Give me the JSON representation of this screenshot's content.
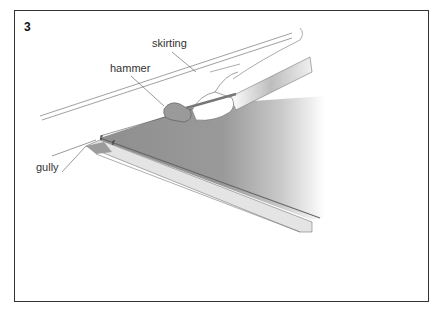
{
  "figure": {
    "number": "3",
    "labels": {
      "skirting": "skirting",
      "hammer": "hammer",
      "gully": "gully"
    }
  }
}
